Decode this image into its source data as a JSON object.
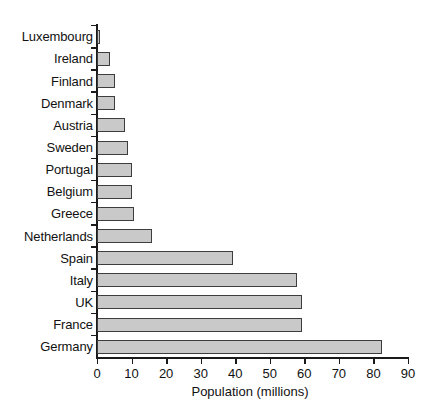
{
  "chart_data": {
    "type": "bar",
    "orientation": "horizontal",
    "title": "",
    "xlabel": "Population (millions)",
    "ylabel": "",
    "xlim": [
      0,
      90
    ],
    "xticks": [
      0,
      10,
      20,
      30,
      40,
      50,
      60,
      70,
      80,
      90
    ],
    "grid": false,
    "legend": null,
    "categories": [
      "Luxembourg",
      "Ireland",
      "Finland",
      "Denmark",
      "Austria",
      "Sweden",
      "Portugal",
      "Belgium",
      "Greece",
      "Netherlands",
      "Spain",
      "Italy",
      "UK",
      "France",
      "Germany"
    ],
    "values": [
      0.4,
      3.9,
      5.2,
      5.3,
      8.1,
      8.9,
      10.0,
      10.2,
      10.6,
      15.9,
      39.5,
      57.8,
      59.2,
      59.2,
      82.5
    ],
    "bar_fill_color": "#c9c9c9",
    "bar_edge_color": "#3d3d3d",
    "axis_color": "#1a1a1a",
    "background_color": "#ffffff"
  },
  "axis": {
    "x_title": "Population (millions)",
    "tick_labels": [
      "0",
      "10",
      "20",
      "30",
      "40",
      "50",
      "60",
      "70",
      "80",
      "90"
    ]
  }
}
